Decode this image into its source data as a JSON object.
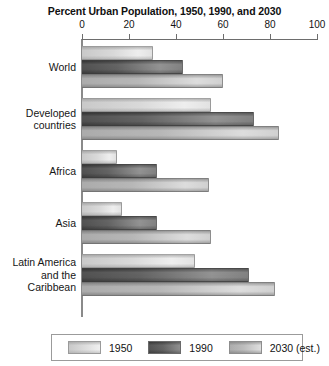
{
  "chart_data": {
    "type": "bar",
    "orientation": "horizontal",
    "title": "Percent Urban Population, 1950, 1990, and 2030",
    "xlabel": "",
    "ylabel": "",
    "xlim": [
      0,
      100
    ],
    "xticks": [
      0,
      20,
      40,
      60,
      80,
      100
    ],
    "grid": false,
    "legend_position": "bottom",
    "categories": [
      "World",
      "Developed\ncountries",
      "Africa",
      "Asia",
      "Latin America\nand the\nCaribbean"
    ],
    "series": [
      {
        "name": "1950",
        "color": "#d9d9d9",
        "values": [
          30,
          55,
          15,
          17,
          48
        ]
      },
      {
        "name": "1990",
        "color": "#5e5e5e",
        "values": [
          43,
          73,
          32,
          32,
          71
        ]
      },
      {
        "name": "2030 (est.)",
        "color": "#b6b6b6",
        "values": [
          60,
          84,
          54,
          55,
          82
        ]
      }
    ]
  },
  "legend": {
    "items": [
      {
        "label": "1950"
      },
      {
        "label": "1990"
      },
      {
        "label": "2030 (est.)"
      }
    ]
  },
  "axis": {
    "tick_labels": [
      "0",
      "20",
      "40",
      "60",
      "80",
      "100"
    ]
  }
}
